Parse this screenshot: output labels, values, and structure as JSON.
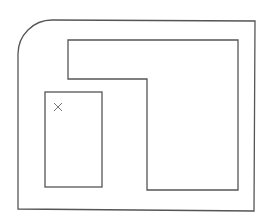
{
  "diagram": {
    "type": "floor-plan-outline",
    "stroke_color": "#555555",
    "marker_color": "#777777",
    "background": "#ffffff",
    "outer_boundary": {
      "x": 18,
      "y": 20,
      "right": 255,
      "bottom": 211,
      "top_left_radius": 34
    },
    "l_shape_region": {
      "points": [
        [
          68,
          40
        ],
        [
          238,
          40
        ],
        [
          238,
          190
        ],
        [
          147,
          190
        ],
        [
          147,
          79
        ],
        [
          68,
          79
        ]
      ]
    },
    "small_rect_region": {
      "x": 45,
      "y": 92,
      "width": 57,
      "height": 95
    },
    "marker": {
      "symbol": "x",
      "cx": 58,
      "cy": 107,
      "size": 8
    }
  }
}
